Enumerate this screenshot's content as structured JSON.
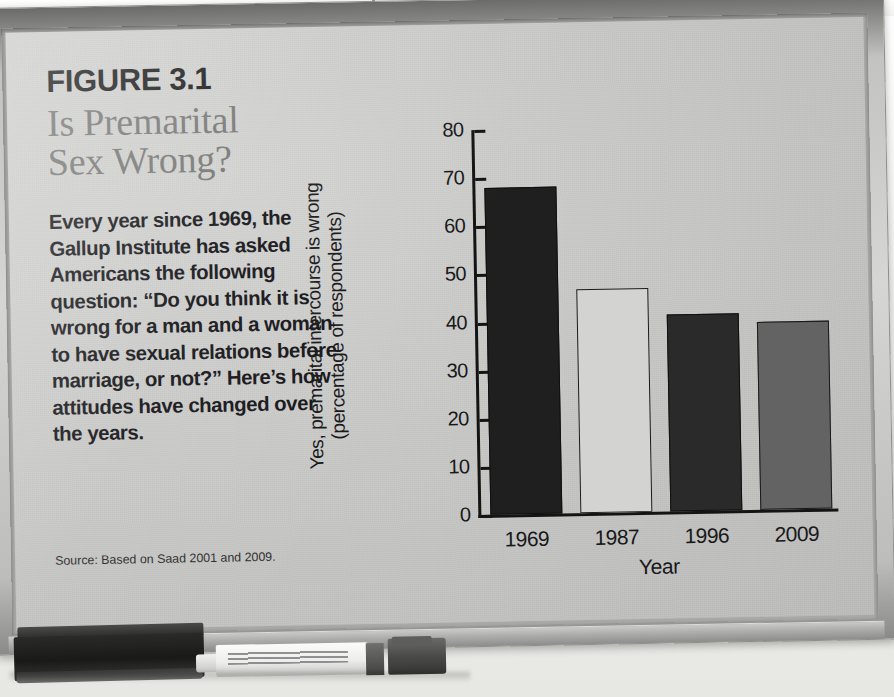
{
  "scene": {
    "description": "Photograph of a printed textbook figure mounted on a whiteboard",
    "board_color": "#c6c6c4",
    "frame_color": "#d6d6d4",
    "wall_color": "#f2f2f0"
  },
  "figure": {
    "number": "FIGURE 3.1",
    "title": "Is Premarital\nSex Wrong?",
    "body": "Every year since 1969, the Gallup Institute has asked Americans the following question: “Do you think it is wrong for a man and a woman to have sexual relations before marriage, or not?” Here’s how attitudes have changed over the years.",
    "source": "Source: Based on Saad 2001 and 2009.",
    "title_color": "#757573",
    "text_color": "#16161a"
  },
  "tray": {
    "eraser_label": "whiteboard-eraser",
    "marker_label": "dry-erase-marker"
  },
  "chart_data": {
    "type": "bar",
    "title": "",
    "categories": [
      "1969",
      "1987",
      "1996",
      "2009"
    ],
    "values": [
      68,
      46.5,
      41,
      39
    ],
    "xlabel": "Year",
    "ylabel": "Yes, premarital intercourse is wrong\n(percentage of respondents)",
    "ylim": [
      0,
      80
    ],
    "yticks": [
      0,
      10,
      20,
      30,
      40,
      50,
      60,
      70,
      80
    ],
    "ytick_labels": [
      "0",
      "10",
      "20",
      "30",
      "40",
      "50",
      "60",
      "70",
      "80"
    ],
    "grid": false,
    "legend": null,
    "bar_colors": [
      "#1f1f1f",
      "#d3d3d1",
      "#2a2a2a",
      "#636363"
    ],
    "bar_edge_colors": [
      "#101010",
      "#1a1a1a",
      "#101010",
      "#1a1a1a"
    ],
    "bars": [
      {
        "category": "1969",
        "value": 68,
        "color": "#1f1f1f",
        "edge": "#101010"
      },
      {
        "category": "1987",
        "value": 46.5,
        "color": "#d3d3d1",
        "edge": "#1a1a1a"
      },
      {
        "category": "1996",
        "value": 41,
        "color": "#2a2a2a",
        "edge": "#101010"
      },
      {
        "category": "2009",
        "value": 39,
        "color": "#636363",
        "edge": "#1a1a1a"
      }
    ]
  }
}
